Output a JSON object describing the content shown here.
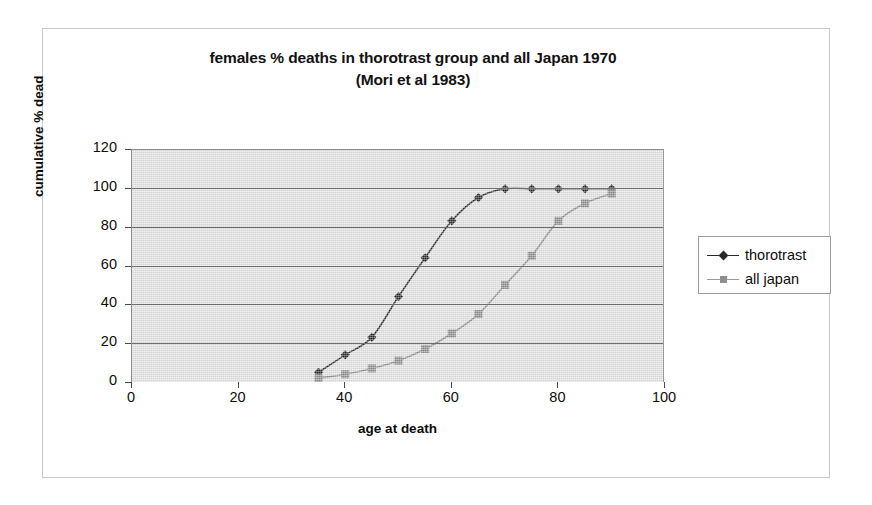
{
  "chart_data": {
    "type": "line",
    "title": "females % deaths in thorotrast group and all Japan 1970",
    "subtitle": "(Mori et al 1983)",
    "xlabel": "age at death",
    "ylabel": "cumulative % dead",
    "xlim": [
      0,
      100
    ],
    "ylim": [
      0,
      120
    ],
    "xticks": [
      0,
      20,
      40,
      60,
      80,
      100
    ],
    "yticks": [
      0,
      20,
      40,
      60,
      80,
      100,
      120
    ],
    "xtick_labels": [
      "0",
      "20",
      "40",
      "60",
      "80",
      "100"
    ],
    "ytick_labels": [
      "0",
      "20",
      "40",
      "60",
      "80",
      "100",
      "120"
    ],
    "grid": "horizontal",
    "legend_position": "right",
    "plot_background": "#e3e3e3",
    "x": [
      35,
      40,
      45,
      50,
      55,
      60,
      65,
      70,
      75,
      80,
      85,
      90
    ],
    "series": [
      {
        "name": "thorotrast",
        "marker": "diamond",
        "color": "#2a2a2a",
        "values": [
          5,
          14,
          23,
          44,
          64,
          83,
          95,
          99.5,
          99.5,
          99.5,
          99.5,
          99.5
        ]
      },
      {
        "name": "all japan",
        "marker": "square",
        "color": "#8e8e8e",
        "values": [
          2,
          4,
          7,
          11,
          17,
          25,
          35,
          50,
          65,
          83,
          92,
          97
        ]
      }
    ]
  },
  "legend": {
    "items": [
      {
        "label": "thorotrast",
        "marker": "diamond-marker",
        "color": "#2a2a2a"
      },
      {
        "label": "all japan",
        "marker": "square-marker",
        "color": "#8e8e8e"
      }
    ]
  }
}
